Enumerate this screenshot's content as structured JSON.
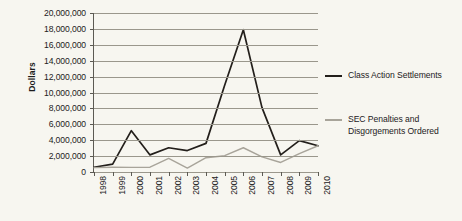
{
  "chart_data": {
    "type": "line",
    "title": "",
    "xlabel": "",
    "ylabel": "Dollars",
    "x": [
      1998,
      1999,
      2000,
      2001,
      2002,
      2003,
      2004,
      2005,
      2006,
      2007,
      2008,
      2009,
      2010
    ],
    "xtick_labels": [
      "1998",
      "1999",
      "2000",
      "2001",
      "2002",
      "2003",
      "2004",
      "2005",
      "2006",
      "2007",
      "2008",
      "2009",
      "2010"
    ],
    "ylim": [
      0,
      20000000
    ],
    "ytick_values": [
      0,
      2000000,
      4000000,
      6000000,
      8000000,
      10000000,
      12000000,
      14000000,
      16000000,
      18000000,
      20000000
    ],
    "ytick_labels": [
      "0",
      "2,000,000",
      "4,000,000",
      "6,000,000",
      "8,000,000",
      "10,000,000",
      "12,000,000",
      "14,000,000",
      "16,000,000",
      "18,000,000",
      "20,000,000"
    ],
    "grid": true,
    "legend_position": "right",
    "series": [
      {
        "name": "Class Action Settlements",
        "color": "#231f1b",
        "values": [
          600000,
          1000000,
          5200000,
          2150000,
          3050000,
          2700000,
          3600000,
          10900000,
          17900000,
          8100000,
          2150000,
          3950000,
          3300000
        ]
      },
      {
        "name": "SEC Penalties and Disgorgements Ordered",
        "color": "#a8a49a",
        "values": [
          550000,
          600000,
          580000,
          600000,
          1700000,
          500000,
          1800000,
          2050000,
          3050000,
          1900000,
          1200000,
          2300000,
          3300000
        ]
      }
    ]
  },
  "legend": {
    "items": [
      {
        "label": "Class Action Settlements",
        "color": "#231f1b"
      },
      {
        "label": "SEC Penalties and\nDisgorgements Ordered",
        "color": "#a8a49a"
      }
    ]
  },
  "axes": {
    "y_title": "Dollars"
  }
}
